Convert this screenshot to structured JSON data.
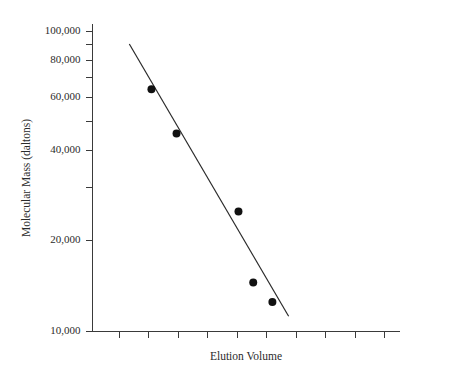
{
  "chart_data": {
    "type": "scatter",
    "title": "",
    "xlabel": "Elution Volume",
    "ylabel": "Molecular Mass (daltons)",
    "yscale": "log",
    "ylim": [
      10000,
      110000
    ],
    "ytick_labels": [
      "100,000",
      "80,000",
      "60,000",
      "40,000",
      "20,000",
      "10,000"
    ],
    "ytick_values": [
      100000,
      80000,
      60000,
      40000,
      20000,
      10000
    ],
    "yminor_tick_values": [
      90000,
      70000,
      50000,
      30000
    ],
    "xtick_labels": [],
    "xtick_count": 11,
    "grid": false,
    "legend": false,
    "series": [
      {
        "name": "Protein standards",
        "marker": "filled-circle",
        "color": "#111111",
        "points": [
          {
            "x": 2.1,
            "y": 64000
          },
          {
            "x": 2.95,
            "y": 45500
          },
          {
            "x": 5.05,
            "y": 25000
          },
          {
            "x": 5.55,
            "y": 14500
          },
          {
            "x": 6.2,
            "y": 12500
          }
        ]
      }
    ],
    "fit_line": {
      "name": "Calibration line",
      "color": "#2a2a2a",
      "start": {
        "x": 1.35,
        "y": 90500
      },
      "end": {
        "x": 6.75,
        "y": 11200
      }
    }
  },
  "axes": {
    "y_title": "Molecular Mass (daltons)",
    "x_title": "Elution Volume"
  }
}
